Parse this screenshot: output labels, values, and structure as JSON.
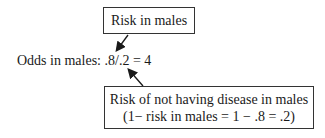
{
  "top_box": {
    "label": "Risk in males"
  },
  "odds_line": {
    "text": "Odds in males: .8/.2 = 4"
  },
  "bottom_box": {
    "line1": "Risk of not having disease in males",
    "line2": "(1− risk in males = 1 − .8 = .2)"
  },
  "colors": {
    "stroke": "#1a1a1a",
    "border": "#333333"
  }
}
